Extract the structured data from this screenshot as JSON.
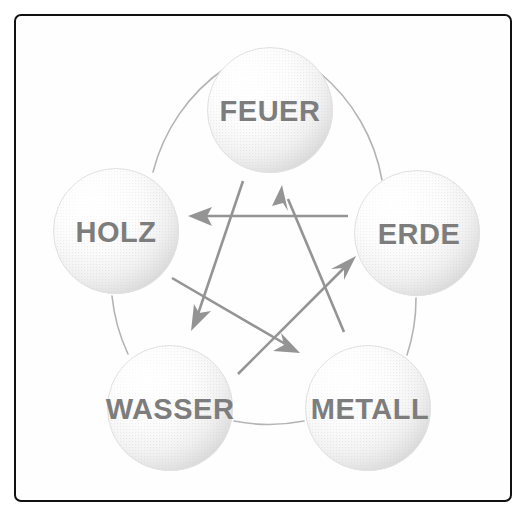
{
  "figure": {
    "frame_color": "#111111",
    "background_color": "#ffffff",
    "label_color": "#7d7d7d",
    "arrow_color": "#949494",
    "ring_color": "#b4b4b4"
  },
  "nodes": [
    {
      "id": "feuer",
      "label": "FEUER",
      "cx": 270,
      "cy": 110,
      "r": 63,
      "font_size": 29
    },
    {
      "id": "erde",
      "label": "ERDE",
      "cx": 417,
      "cy": 233,
      "r": 63,
      "font_size": 29
    },
    {
      "id": "metall",
      "label": "METALL",
      "cx": 368,
      "cy": 408,
      "r": 63,
      "font_size": 29
    },
    {
      "id": "wasser",
      "label": "WASSER",
      "cx": 170,
      "cy": 408,
      "r": 63,
      "font_size": 29
    },
    {
      "id": "holz",
      "label": "HOLZ",
      "cx": 116,
      "cy": 231,
      "r": 63,
      "font_size": 29
    }
  ],
  "generating_cycle": {
    "name": "Naehrungszyklus",
    "description": "Aussenkreis verbindet benachbarte Elemente",
    "edges": [
      {
        "from": "holz",
        "to": "feuer"
      },
      {
        "from": "feuer",
        "to": "erde"
      },
      {
        "from": "erde",
        "to": "metall"
      },
      {
        "from": "metall",
        "to": "wasser"
      },
      {
        "from": "wasser",
        "to": "holz"
      }
    ]
  },
  "controlling_cycle": {
    "name": "Kontrollzyklus",
    "description": "Pentagramm-Pfeile im Inneren",
    "edges": [
      {
        "from": "erde",
        "to": "holz",
        "x1": 348,
        "y1": 216,
        "x2": 188,
        "y2": 216
      },
      {
        "from": "metall",
        "to": "feuer",
        "x1": 344,
        "y1": 332,
        "x2": 282,
        "y2": 185
      },
      {
        "from": "feuer",
        "to": "wasser",
        "x1": 243,
        "y1": 181,
        "x2": 191,
        "y2": 331
      },
      {
        "from": "wasser",
        "to": "erde",
        "x1": 238,
        "y1": 374,
        "x2": 356,
        "y2": 256
      },
      {
        "from": "holz",
        "to": "metall",
        "x1": 172,
        "y1": 278,
        "x2": 300,
        "y2": 353
      }
    ]
  }
}
